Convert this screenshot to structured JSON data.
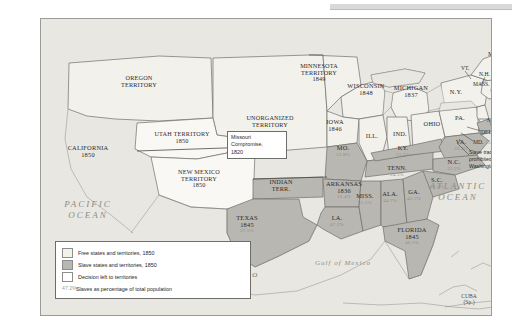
{
  "map": {
    "title_absent": true,
    "colors": {
      "free": "#f2f1ec",
      "slave": "#b9b7b1",
      "decision": "#ffffff",
      "ocean": "#e9e7e1",
      "percent_text": "#8e8e8e",
      "border": "#6d6d6a"
    },
    "callout": {
      "line1": "Missouri",
      "line2": "Compromise,",
      "line3": "1820"
    },
    "dc_note": {
      "line1": "Slave trade",
      "line2": "prohibited in",
      "line3": "Washington, D.C."
    },
    "oceans": [
      {
        "name": "pacific-ocean-label",
        "line1": "PACIFIC",
        "line2": "OCEAN"
      },
      {
        "name": "atlantic-ocean-label",
        "line1": "ATLANTIC",
        "line2": "OCEAN"
      }
    ],
    "gulf_label": "Gulf of Mexico",
    "mexico_label": "M E X I C O",
    "cuba": {
      "name": "CUBA",
      "note": "(Sp.)"
    },
    "territories": [
      {
        "name": "OREGON TERRITORY",
        "line1": "OREGON",
        "line2": "TERRITORY",
        "year": ""
      },
      {
        "name": "UTAH TERRITORY",
        "line1": "UTAH TERRITORY",
        "line2": "",
        "year": "1850"
      },
      {
        "name": "NEW MEXICO TERRITORY",
        "line1": "NEW MEXICO",
        "line2": "TERRITORY",
        "year": "1850"
      },
      {
        "name": "UNORGANIZED TERRITORY",
        "line1": "UNORGANIZED",
        "line2": "TERRITORY",
        "year": ""
      },
      {
        "name": "MINNESOTA TERRITORY",
        "line1": "MINNESOTA",
        "line2": "TERRITORY",
        "year": "1849"
      },
      {
        "name": "INDIAN TERR.",
        "line1": "INDIAN",
        "line2": "TERR.",
        "year": ""
      }
    ],
    "states": [
      {
        "label": "CALIFORNIA",
        "year": "1850",
        "pct": ""
      },
      {
        "label": "TEXAS",
        "year": "1845",
        "pct": "27.5%"
      },
      {
        "label": "IOWA",
        "year": "1846",
        "pct": ""
      },
      {
        "label": "WISCONSIN",
        "year": "1848",
        "pct": ""
      },
      {
        "label": "MICHIGAN",
        "year": "1837",
        "pct": ""
      },
      {
        "label": "ILL.",
        "year": "",
        "pct": ""
      },
      {
        "label": "IND.",
        "year": "",
        "pct": ""
      },
      {
        "label": "OHIO",
        "year": "",
        "pct": ""
      },
      {
        "label": "PA.",
        "year": "",
        "pct": ""
      },
      {
        "label": "N.Y.",
        "year": "",
        "pct": ""
      },
      {
        "label": "ME.",
        "year": "",
        "pct": ""
      },
      {
        "label": "MO.",
        "year": "",
        "pct": "12.8%"
      },
      {
        "label": "ARKANSAS",
        "year": "1836",
        "pct": "22.4%"
      },
      {
        "label": "KY.",
        "year": "",
        "pct": "21.5%"
      },
      {
        "label": "TENN.",
        "year": "",
        "pct": "24.5%"
      },
      {
        "label": "VA.",
        "year": "",
        "pct": "33.2%"
      },
      {
        "label": "N.C.",
        "year": "",
        "pct": "33.2%"
      },
      {
        "label": "S.C.",
        "year": "",
        "pct": "57.5%"
      },
      {
        "label": "GA.",
        "year": "",
        "pct": "42.7%"
      },
      {
        "label": "ALA.",
        "year": "",
        "pct": "44.7%"
      },
      {
        "label": "MISS.",
        "year": "",
        "pct": "51.1%"
      },
      {
        "label": "LA.",
        "year": "",
        "pct": "47.2%"
      },
      {
        "label": "FLORIDA",
        "year": "1845",
        "pct": "46.5%"
      }
    ],
    "northeast": [
      {
        "label": "VT.",
        "pct": ""
      },
      {
        "label": "N.H.",
        "pct": ""
      },
      {
        "label": "MASS.",
        "pct": ""
      },
      {
        "label": "R.I.",
        "pct": ""
      },
      {
        "label": "CONN.",
        "pct": ""
      },
      {
        "label": "N.J.",
        "pct": ""
      },
      {
        "label": "DEL.",
        "pct": "2.5%"
      },
      {
        "label": "MD.",
        "pct": "15.5%"
      }
    ],
    "legend": {
      "items": [
        {
          "swatch": "free",
          "text": "Free states and territories, 1850"
        },
        {
          "swatch": "slave",
          "text": "Slave states and territories, 1850"
        },
        {
          "swatch": "decision",
          "text": "Decision left to territories"
        },
        {
          "swatch": "percent",
          "marker": "47.2%",
          "text": "Slaves as percentage of total population"
        }
      ]
    }
  }
}
